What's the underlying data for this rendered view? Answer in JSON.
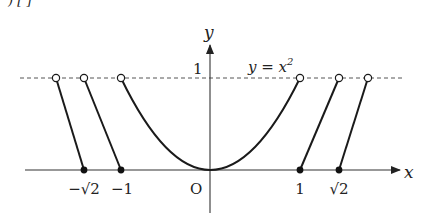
{
  "header": {
    "cut_off_text": ")          [  ]"
  },
  "diagram": {
    "type": "function-graph",
    "axes": {
      "x_label": "x",
      "y_label": "y",
      "origin_label": "O",
      "y_tick_label": "1"
    },
    "curve_label": "y = x",
    "curve_label_exponent": "2",
    "x_tick_labels": [
      "−√2",
      "−1",
      "1",
      "√2"
    ],
    "reference_line": {
      "y": 1,
      "style": "dashed"
    },
    "pieces": [
      {
        "from": [
          -2.0,
          1
        ],
        "to": [
          -1.414,
          0
        ],
        "start_open": true,
        "end_closed": true
      },
      {
        "from": [
          -1.414,
          1
        ],
        "to": [
          -1.0,
          0
        ],
        "start_open": true,
        "end_closed": true
      },
      {
        "curve": "y = x^2",
        "domain": [
          -1,
          1
        ],
        "endpoints_open": true
      },
      {
        "from": [
          1.0,
          0
        ],
        "to": [
          1.414,
          1
        ],
        "start_closed": true,
        "end_open": true
      },
      {
        "from": [
          1.414,
          0
        ],
        "to": [
          1.78,
          1
        ],
        "start_closed": true,
        "end_open": true
      }
    ],
    "colors": {
      "stroke": "#1a1a1a",
      "axis": "#333333",
      "dashed": "#555555"
    }
  }
}
